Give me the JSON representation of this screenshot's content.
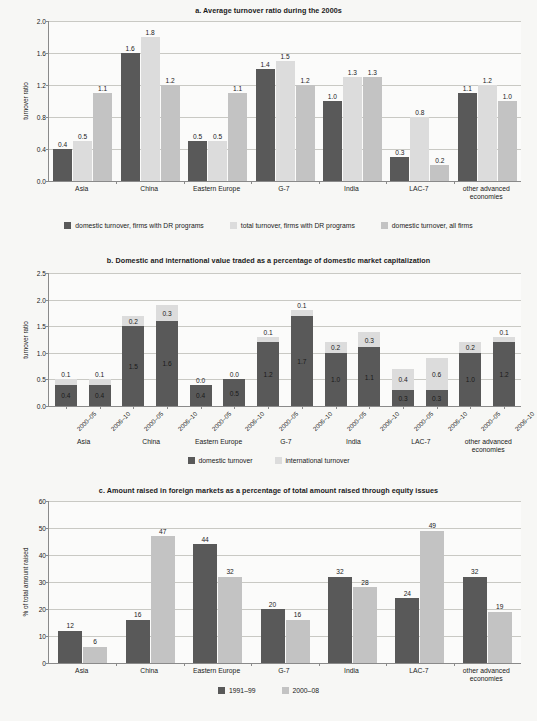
{
  "colors": {
    "dark": "#595959",
    "light": "#dcdcdc",
    "medium": "#c3c3c3",
    "page_bg": "#f7f7f5",
    "plot_bg": "#fbfbfa",
    "grid": "#c9c9c4",
    "axis": "#8a8a8a"
  },
  "chart_data": [
    {
      "id": "a",
      "type": "bar",
      "title": "a. Average turnover ratio during the 2000s",
      "xlabel": "",
      "ylabel": "turnover ratio",
      "ylim": [
        0,
        2.0
      ],
      "yticks": [
        "0.0",
        "0.4",
        "0.8",
        "1.2",
        "1.6",
        "2.0"
      ],
      "ytick_values": [
        0,
        0.4,
        0.8,
        1.2,
        1.6,
        2.0
      ],
      "grid": true,
      "legend_position": "bottom",
      "categories": [
        "Asia",
        "China",
        "Eastern Europe",
        "G-7",
        "India",
        "LAC-7",
        "other advanced economies"
      ],
      "series": [
        {
          "name": "domestic turnover, firms with DR programs",
          "color_key": "dark",
          "values": [
            0.4,
            1.6,
            0.5,
            1.4,
            1.0,
            0.3,
            1.1
          ],
          "labels": [
            "0.4",
            "1.6",
            "0.5",
            "1.4",
            "1.0",
            "0.3",
            "1.1"
          ]
        },
        {
          "name": "total turnover, firms with DR programs",
          "color_key": "light",
          "values": [
            0.5,
            1.8,
            0.5,
            1.5,
            1.3,
            0.8,
            1.2
          ],
          "labels": [
            "0.5",
            "1.8",
            "0.5",
            "1.5",
            "1.3",
            "0.8",
            "1.2"
          ]
        },
        {
          "name": "domestic turnover,  all firms",
          "color_key": "medium",
          "values": [
            1.1,
            1.2,
            1.1,
            1.2,
            1.3,
            0.2,
            1.0
          ],
          "labels": [
            "1.1",
            "1.2",
            "1.1",
            "1.2",
            "1.3",
            "0.2",
            "1.0"
          ]
        }
      ]
    },
    {
      "id": "b",
      "type": "bar",
      "stacked": true,
      "title": "b. Domestic and international value traded as a percentage of domestic market capitalization",
      "xlabel": "",
      "ylabel": "turnover ratio",
      "ylim": [
        0,
        2.5
      ],
      "yticks": [
        "0.0",
        "0.5",
        "1.0",
        "1.5",
        "2.0",
        "2.5"
      ],
      "ytick_values": [
        0,
        0.5,
        1.0,
        1.5,
        2.0,
        2.5
      ],
      "grid": true,
      "legend_position": "bottom",
      "periods": [
        "2000–05",
        "2006–10"
      ],
      "groups": [
        "Asia",
        "China",
        "Eastern Europe",
        "G-7",
        "India",
        "LAC-7",
        "other advanced economies"
      ],
      "x": [
        "2000–05",
        "2006–10",
        "2000–05",
        "2006–10",
        "2000–05",
        "2006–10",
        "2000–05",
        "2006–10",
        "2000–05",
        "2006–10",
        "2000–05",
        "2006–10",
        "2000–05",
        "2006–10"
      ],
      "series": [
        {
          "name": "domestic turnover",
          "color_key": "dark",
          "values": [
            0.4,
            0.4,
            1.5,
            1.6,
            0.4,
            0.5,
            1.2,
            1.7,
            1.0,
            1.1,
            0.3,
            0.3,
            1.0,
            1.2
          ],
          "labels": [
            "0.4",
            "0.4",
            "1.5",
            "1.6",
            "0.4",
            "0.5",
            "1.2",
            "1.7",
            "1.0",
            "1.1",
            "0.3",
            "0.3",
            "1.0",
            "1.2"
          ]
        },
        {
          "name": "international turnover",
          "color_key": "light",
          "values": [
            0.1,
            0.1,
            0.2,
            0.3,
            0.0,
            0.0,
            0.1,
            0.1,
            0.2,
            0.3,
            0.4,
            0.6,
            0.2,
            0.1
          ],
          "labels": [
            "0.1",
            "0.1",
            "0.2",
            "0.3",
            "0.0",
            "0.0",
            "0.1",
            "0.1",
            "0.2",
            "0.3",
            "0.4",
            "0.6",
            "0.2",
            "0.1"
          ]
        }
      ]
    },
    {
      "id": "c",
      "type": "bar",
      "title": "c. Amount raised in foreign markets as a percentage of total amount raised through equity issues",
      "xlabel": "",
      "ylabel": "% of total amount raised",
      "ylim": [
        0,
        60
      ],
      "yticks": [
        "0",
        "10",
        "20",
        "30",
        "40",
        "50",
        "60"
      ],
      "ytick_values": [
        0,
        10,
        20,
        30,
        40,
        50,
        60
      ],
      "grid": true,
      "legend_position": "bottom",
      "categories": [
        "Asia",
        "China",
        "Eastern Europe",
        "G-7",
        "India",
        "LAC-7",
        "other advanced economies"
      ],
      "series": [
        {
          "name": "1991–99",
          "color_key": "dark",
          "values": [
            12,
            16,
            44,
            20,
            32,
            24,
            32
          ],
          "labels": [
            "12",
            "16",
            "44",
            "20",
            "32",
            "24",
            "32"
          ]
        },
        {
          "name": "2000–08",
          "color_key": "medium",
          "values": [
            6,
            47,
            32,
            16,
            28,
            49,
            19
          ],
          "labels": [
            "6",
            "47",
            "32",
            "16",
            "28",
            "49",
            "19"
          ]
        }
      ]
    }
  ]
}
